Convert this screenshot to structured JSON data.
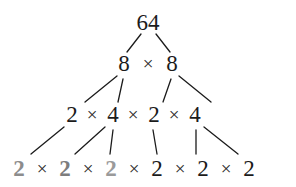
{
  "figure": {
    "background_color": "#ffffff",
    "ink_color": "#1b1b1b",
    "highlight_color": "#8c8c8c"
  },
  "operator": {
    "symbol": "×",
    "name": "multiplication-sign"
  },
  "rows": [
    {
      "id": "row-root",
      "y": 22,
      "nodes": [
        {
          "label": "64",
          "x": 148,
          "bold": false,
          "color": "#1b1b1b"
        }
      ],
      "operators": []
    },
    {
      "id": "row-level-1",
      "y": 63,
      "nodes": [
        {
          "label": "8",
          "x": 124,
          "bold": false,
          "color": "#1b1b1b"
        },
        {
          "label": "8",
          "x": 172,
          "bold": false,
          "color": "#1b1b1b"
        }
      ],
      "operators": [
        {
          "symbol": "×",
          "x": 148
        }
      ]
    },
    {
      "id": "row-level-2",
      "y": 114,
      "nodes": [
        {
          "label": "2",
          "x": 72,
          "bold": false,
          "color": "#1b1b1b"
        },
        {
          "label": "4",
          "x": 113,
          "bold": false,
          "color": "#1b1b1b"
        },
        {
          "label": "2",
          "x": 154,
          "bold": false,
          "color": "#1b1b1b"
        },
        {
          "label": "4",
          "x": 195,
          "bold": false,
          "color": "#1b1b1b"
        }
      ],
      "operators": [
        {
          "symbol": "×",
          "x": 92
        },
        {
          "symbol": "×",
          "x": 133
        },
        {
          "symbol": "×",
          "x": 174
        }
      ]
    },
    {
      "id": "row-leaves",
      "y": 168,
      "nodes": [
        {
          "label": "2",
          "x": 19,
          "bold": true,
          "color": "#8c8c8c"
        },
        {
          "label": "2",
          "x": 65,
          "bold": true,
          "color": "#7d7d7d"
        },
        {
          "label": "2",
          "x": 111,
          "bold": true,
          "color": "#9a9a9a"
        },
        {
          "label": "2",
          "x": 157,
          "bold": false,
          "color": "#1b1b1b"
        },
        {
          "label": "2",
          "x": 203,
          "bold": false,
          "color": "#1b1b1b"
        },
        {
          "label": "2",
          "x": 249,
          "bold": false,
          "color": "#1b1b1b"
        }
      ],
      "operators": [
        {
          "symbol": "×",
          "x": 42
        },
        {
          "symbol": "×",
          "x": 88
        },
        {
          "symbol": "×",
          "x": 134
        },
        {
          "symbol": "×",
          "x": 180
        },
        {
          "symbol": "×",
          "x": 226
        }
      ]
    }
  ],
  "edges": [
    {
      "name": "edge-64-to-left-8",
      "x1": 141,
      "y1": 34,
      "x2": 127,
      "y2": 52
    },
    {
      "name": "edge-64-to-right-8",
      "x1": 156,
      "y1": 34,
      "x2": 170,
      "y2": 52
    },
    {
      "name": "edge-left8-to-2",
      "x1": 117,
      "y1": 76,
      "x2": 85,
      "y2": 102
    },
    {
      "name": "edge-left8-to-4",
      "x1": 123,
      "y1": 79,
      "x2": 118,
      "y2": 102
    },
    {
      "name": "edge-right8-to-2",
      "x1": 171,
      "y1": 79,
      "x2": 163,
      "y2": 102
    },
    {
      "name": "edge-right8-to-4",
      "x1": 179,
      "y1": 76,
      "x2": 211,
      "y2": 102
    },
    {
      "name": "edge-2a-to-leaf1",
      "x1": 64,
      "y1": 127,
      "x2": 31,
      "y2": 154
    },
    {
      "name": "edge-4a-to-leaf2",
      "x1": 105,
      "y1": 127,
      "x2": 75,
      "y2": 154
    },
    {
      "name": "edge-4a-to-leaf3",
      "x1": 113,
      "y1": 130,
      "x2": 110,
      "y2": 154
    },
    {
      "name": "edge-2b-to-leaf4",
      "x1": 153,
      "y1": 130,
      "x2": 157,
      "y2": 154
    },
    {
      "name": "edge-4b-to-leaf5",
      "x1": 196,
      "y1": 130,
      "x2": 196,
      "y2": 154
    },
    {
      "name": "edge-4b-to-leaf6",
      "x1": 204,
      "y1": 127,
      "x2": 238,
      "y2": 154
    }
  ]
}
